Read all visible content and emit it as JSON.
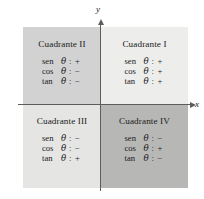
{
  "figure": {
    "axes": {
      "y_label": "y",
      "x_label": "x"
    },
    "quadrants": [
      {
        "key": "q1",
        "title": "Cuadrante I",
        "ratios": [
          {
            "fn": "sen",
            "theta": "θ",
            "colon": ":",
            "sign": "+"
          },
          {
            "fn": "cos",
            "theta": "θ",
            "colon": ":",
            "sign": "+"
          },
          {
            "fn": "tan",
            "theta": "θ",
            "colon": ":",
            "sign": "+"
          }
        ]
      },
      {
        "key": "q2",
        "title": "Cuadrante II",
        "ratios": [
          {
            "fn": "sen",
            "theta": "θ",
            "colon": ":",
            "sign": "+"
          },
          {
            "fn": "cos",
            "theta": "θ",
            "colon": ":",
            "sign": "−"
          },
          {
            "fn": "tan",
            "theta": "θ",
            "colon": ":",
            "sign": "−"
          }
        ]
      },
      {
        "key": "q3",
        "title": "Cuadrante III",
        "ratios": [
          {
            "fn": "sen",
            "theta": "θ",
            "colon": ":",
            "sign": "−"
          },
          {
            "fn": "cos",
            "theta": "θ",
            "colon": ":",
            "sign": "−"
          },
          {
            "fn": "tan",
            "theta": "θ",
            "colon": ":",
            "sign": "+"
          }
        ]
      },
      {
        "key": "q4",
        "title": "Cuadrante IV",
        "ratios": [
          {
            "fn": "sen",
            "theta": "θ",
            "colon": ":",
            "sign": "−"
          },
          {
            "fn": "cos",
            "theta": "θ",
            "colon": ":",
            "sign": "+"
          },
          {
            "fn": "tan",
            "theta": "θ",
            "colon": ":",
            "sign": "−"
          }
        ]
      }
    ],
    "colors": {
      "q1_fill": "#ededec",
      "q2_fill": "#d2d2d2",
      "q3_fill": "#e5e5e4",
      "q4_fill": "#b7b7b6",
      "axis": "#5d5d5d",
      "text": "#1b1b1b"
    }
  }
}
